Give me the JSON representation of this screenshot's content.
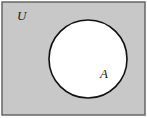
{
  "diagram": {
    "type": "venn",
    "universe": {
      "label": "U",
      "fill": "#c8c8c8",
      "stroke": "#555555"
    },
    "sets": [
      {
        "label": "A",
        "fill": "#ffffff",
        "stroke": "#111111"
      }
    ]
  }
}
